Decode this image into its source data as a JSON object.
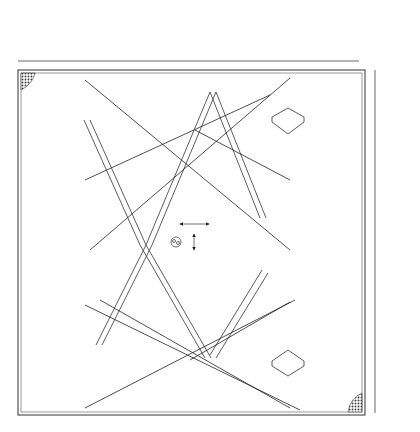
{
  "drawing": {
    "type": "structural-plan",
    "colors": {
      "line": "#333333",
      "beam": "#555555",
      "hatch": "#444444",
      "paper": "#ffffff"
    }
  },
  "top_dimensions": [
    {
      "label": "4000",
      "x1": 18,
      "x2": 80
    },
    {
      "label": "4000",
      "x1": 80,
      "x2": 146
    },
    {
      "label": "4000",
      "x1": 146,
      "x2": 212
    },
    {
      "label": "5000",
      "x1": 212,
      "x2": 294
    },
    {
      "label": "4000",
      "x1": 294,
      "x2": 359
    }
  ],
  "right_dimensions": [
    {
      "label": "3000",
      "y1": 70,
      "y2": 118
    },
    {
      "label": "7500",
      "y1": 118,
      "y2": 240
    },
    {
      "label": "7500",
      "y1": 240,
      "y2": 357
    },
    {
      "label": "3000",
      "y1": 357,
      "y2": 413
    }
  ],
  "axis_labels": {
    "top": {
      "label": "2Q",
      "x": 293,
      "y": 20
    },
    "right": [
      {
        "label": "QB",
        "y": 118
      },
      {
        "label": "QC",
        "y": 240
      },
      {
        "label": "QA",
        "y": 357
      }
    ]
  },
  "cable_labels": [
    {
      "label": "SL1",
      "x": 116,
      "y": 90
    },
    {
      "label": "SL1",
      "x": 258,
      "y": 90
    },
    {
      "label": "SL1",
      "x": 109,
      "y": 157
    },
    {
      "label": "SL1",
      "x": 255,
      "y": 160
    },
    {
      "label": "SL2",
      "x": 115,
      "y": 321
    },
    {
      "label": "SL2",
      "x": 250,
      "y": 329
    },
    {
      "label": "SL2",
      "x": 116,
      "y": 398
    },
    {
      "label": "SL2",
      "x": 236,
      "y": 396
    }
  ],
  "angle_labels": [
    {
      "label": "62.6°",
      "x": 88,
      "y": 92,
      "rot": -55
    },
    {
      "label": "62.6°",
      "x": 294,
      "y": 94,
      "rot": 50
    },
    {
      "label": "62.6°",
      "x": 92,
      "y": 160,
      "rot": 55
    },
    {
      "label": "62.6°",
      "x": 272,
      "y": 160,
      "rot": -50
    },
    {
      "label": "62.6°",
      "x": 92,
      "y": 328,
      "rot": -55
    },
    {
      "label": "62.6°",
      "x": 284,
      "y": 328,
      "rot": 50
    },
    {
      "label": "62.6°",
      "x": 100,
      "y": 388,
      "rot": 30
    },
    {
      "label": "62.6°",
      "x": 280,
      "y": 383,
      "rot": -40
    }
  ],
  "length_labels": [
    {
      "label": "6532",
      "x": 230,
      "y": 168,
      "rot": 62
    },
    {
      "label": "6558",
      "x": 234,
      "y": 305,
      "rot": -62
    },
    {
      "label": "1934",
      "x": 196,
      "y": 222,
      "rot": 0
    },
    {
      "label": "5",
      "x": 190,
      "y": 256,
      "rot": 0
    }
  ],
  "cable_anchors": [
    {
      "x": 80,
      "y": 77
    },
    {
      "x": 293,
      "y": 76
    },
    {
      "x": 82,
      "y": 181
    },
    {
      "x": 290,
      "y": 180
    },
    {
      "x": 82,
      "y": 305
    },
    {
      "x": 291,
      "y": 302
    },
    {
      "x": 82,
      "y": 409
    },
    {
      "x": 292,
      "y": 408
    }
  ],
  "caption": ""
}
